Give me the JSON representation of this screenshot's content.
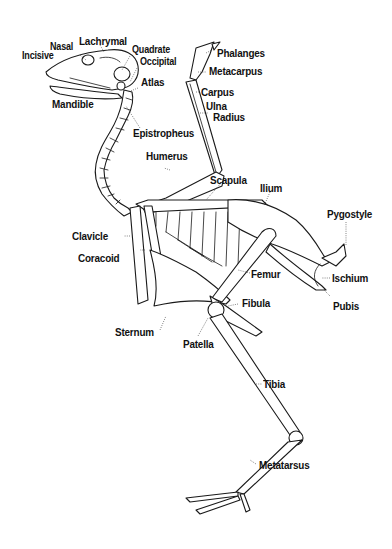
{
  "diagram": {
    "labels": {
      "incisive": "Incisive",
      "nasal": "Nasal",
      "lachrymal": "Lachrymal",
      "quadrate": "Quadrate",
      "occipital": "Occipital",
      "atlas": "Atlas",
      "mandible": "Mandible",
      "epistropheus": "Epistropheus",
      "phalanges": "Phalanges",
      "metacarpus": "Metacarpus",
      "carpus": "Carpus",
      "ulna": "Ulna",
      "radius": "Radius",
      "humerus": "Humerus",
      "scapula": "Scapula",
      "ilium": "Ilium",
      "pygostyle": "Pygostyle",
      "clavicle": "Clavicle",
      "coracoid": "Coracoid",
      "femur": "Femur",
      "ischium": "Ischium",
      "pubis": "Pubis",
      "fibula": "Fibula",
      "sternum": "Sternum",
      "patella": "Patella",
      "tibia": "Tibia",
      "metatarsus": "Metatarsus"
    }
  }
}
